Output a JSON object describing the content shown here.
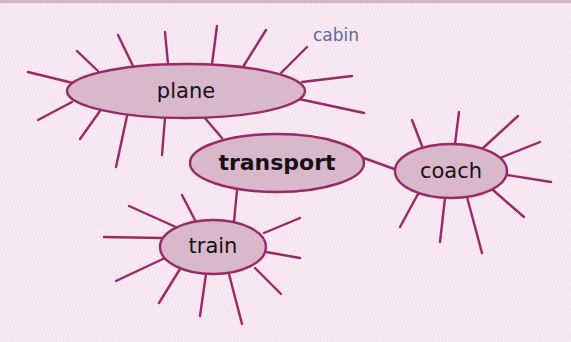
{
  "diagram": {
    "type": "spider-diagram",
    "colors": {
      "background": "#f6e4f0",
      "line": "#9a2a62",
      "node_fill": "#d9b8cc",
      "text": "#1a1014",
      "annotation": "#5b6a9c"
    },
    "central_node": {
      "id": "transport",
      "label": "transport",
      "bold": true
    },
    "nodes": [
      {
        "id": "plane",
        "label": "plane"
      },
      {
        "id": "transport",
        "label": "transport"
      },
      {
        "id": "coach",
        "label": "coach"
      },
      {
        "id": "train",
        "label": "train"
      }
    ],
    "edges": [
      {
        "from": "transport",
        "to": "plane"
      },
      {
        "from": "transport",
        "to": "train"
      },
      {
        "from": "transport",
        "to": "coach"
      }
    ],
    "annotations": [
      {
        "text": "cabin",
        "attached_to": "plane"
      }
    ],
    "empty_branch_counts": {
      "plane": 13,
      "train": 10,
      "coach": 9
    }
  }
}
